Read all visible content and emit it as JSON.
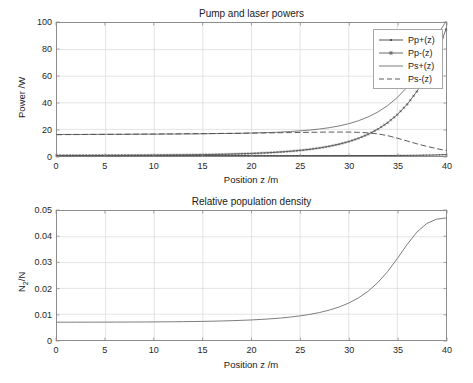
{
  "figure": {
    "background": "#ffffff",
    "axis_color": "#8d8d8d",
    "grid_color": "#d9d9d9",
    "text_color": "#262626"
  },
  "chart_data": [
    {
      "type": "line",
      "title": "Pump and laser powers",
      "xlabel": "Position z /m",
      "ylabel": "Power /W",
      "xlim": [
        0,
        40
      ],
      "ylim": [
        0,
        100
      ],
      "xticks": [
        0,
        5,
        10,
        15,
        20,
        25,
        30,
        35,
        40
      ],
      "yticks": [
        0,
        20,
        40,
        60,
        80,
        100
      ],
      "grid": true,
      "legend_position": "upper-right",
      "x": [
        0,
        1,
        2,
        3,
        4,
        5,
        6,
        7,
        8,
        9,
        10,
        11,
        12,
        13,
        14,
        15,
        16,
        17,
        18,
        19,
        20,
        21,
        22,
        23,
        24,
        25,
        26,
        27,
        28,
        29,
        30,
        31,
        32,
        33,
        34,
        35,
        36,
        37,
        38,
        39,
        40
      ],
      "series": [
        {
          "name": "Pp+(z)",
          "color": "#404040",
          "linestyle": "solid",
          "marker": "dot",
          "values": [
            0.3,
            0.3,
            0.3,
            0.3,
            0.3,
            0.3,
            0.3,
            0.3,
            0.3,
            0.3,
            0.3,
            0.3,
            0.3,
            0.3,
            0.3,
            0.3,
            0.3,
            0.3,
            0.3,
            0.31,
            0.31,
            0.31,
            0.31,
            0.31,
            0.31,
            0.32,
            0.32,
            0.32,
            0.33,
            0.33,
            0.34,
            0.35,
            0.36,
            0.38,
            0.4,
            0.44,
            0.49,
            0.56,
            0.66,
            0.8,
            1.0
          ]
        },
        {
          "name": "Pp-(z)",
          "color": "#5a5a5a",
          "linestyle": "solid",
          "marker": "asterisk",
          "values": [
            0.45,
            0.46,
            0.47,
            0.48,
            0.5,
            0.52,
            0.54,
            0.57,
            0.6,
            0.64,
            0.68,
            0.73,
            0.79,
            0.86,
            0.94,
            1.04,
            1.16,
            1.3,
            1.47,
            1.67,
            1.92,
            2.22,
            2.58,
            3.02,
            3.56,
            4.22,
            5.03,
            6.04,
            7.3,
            8.87,
            10.83,
            13.28,
            16.35,
            20.2,
            25.04,
            31.12,
            38.78,
            48.43,
            60.6,
            75.95,
            95.3
          ]
        },
        {
          "name": "Ps+(z)",
          "color": "#6e6e6e",
          "linestyle": "solid",
          "marker": "none",
          "values": [
            16.2,
            16.2,
            16.2,
            16.2,
            16.3,
            16.3,
            16.3,
            16.3,
            16.4,
            16.4,
            16.4,
            16.5,
            16.5,
            16.6,
            16.6,
            16.7,
            16.8,
            16.9,
            17.0,
            17.1,
            17.3,
            17.5,
            17.7,
            18.0,
            18.4,
            18.9,
            19.5,
            20.3,
            21.3,
            22.6,
            24.3,
            26.5,
            29.4,
            33.1,
            37.9,
            44.0,
            51.8,
            61.7,
            74.3,
            90.2,
            101.0
          ]
        },
        {
          "name": "Ps-(z)",
          "color": "#4a4a4a",
          "linestyle": "dashed",
          "marker": "none",
          "values": [
            16.0,
            16.1,
            16.1,
            16.2,
            16.2,
            16.3,
            16.3,
            16.4,
            16.4,
            16.5,
            16.5,
            16.6,
            16.6,
            16.7,
            16.8,
            16.8,
            16.9,
            17.0,
            17.0,
            17.1,
            17.2,
            17.3,
            17.4,
            17.5,
            17.6,
            17.7,
            17.8,
            17.9,
            18.0,
            18.0,
            18.0,
            17.8,
            17.4,
            16.6,
            15.3,
            13.4,
            11.3,
            9.2,
            7.3,
            5.6,
            4.1
          ]
        }
      ]
    },
    {
      "type": "line",
      "title": "Relative population density",
      "xlabel": "Position z /m",
      "ylabel": "N2/N",
      "ylabel_display": "N₂/N",
      "xlim": [
        0,
        40
      ],
      "ylim": [
        0,
        0.05
      ],
      "xticks": [
        0,
        5,
        10,
        15,
        20,
        25,
        30,
        35,
        40
      ],
      "yticks": [
        0,
        0.01,
        0.02,
        0.03,
        0.04,
        0.05
      ],
      "ytick_labels": [
        "0",
        "0.01",
        "0.02",
        "0.03",
        "0.04",
        "0.05"
      ],
      "grid": true,
      "x": [
        0,
        1,
        2,
        3,
        4,
        5,
        6,
        7,
        8,
        9,
        10,
        11,
        12,
        13,
        14,
        15,
        16,
        17,
        18,
        19,
        20,
        21,
        22,
        23,
        24,
        25,
        26,
        27,
        28,
        29,
        30,
        31,
        32,
        33,
        34,
        35,
        36,
        37,
        38,
        39,
        40
      ],
      "series": [
        {
          "name": "N2/N",
          "color": "#6e6e6e",
          "linestyle": "solid",
          "marker": "none",
          "values": [
            0.0069,
            0.0069,
            0.00691,
            0.00691,
            0.00692,
            0.00693,
            0.00694,
            0.00695,
            0.00697,
            0.00699,
            0.00701,
            0.00704,
            0.00707,
            0.00711,
            0.00716,
            0.00722,
            0.00729,
            0.00738,
            0.00749,
            0.00762,
            0.00778,
            0.00798,
            0.00822,
            0.00852,
            0.00889,
            0.00935,
            0.00993,
            0.01066,
            0.01159,
            0.01278,
            0.01432,
            0.01632,
            0.01893,
            0.0223,
            0.02655,
            0.0316,
            0.037,
            0.0418,
            0.0451,
            0.0468,
            0.0473
          ]
        }
      ]
    }
  ],
  "legend": {
    "items": [
      {
        "label": "Pp+(z)",
        "style": "line-dot"
      },
      {
        "label": "Pp-(z)",
        "style": "line-asterisk"
      },
      {
        "label": "Ps+(z)",
        "style": "line-plain"
      },
      {
        "label": "Ps-(z)",
        "style": "line-dashed"
      }
    ]
  }
}
